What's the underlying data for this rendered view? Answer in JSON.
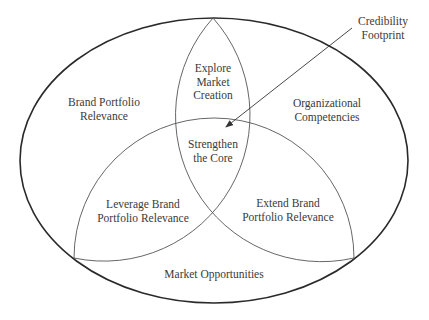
{
  "diagram": {
    "type": "venn-ellipse",
    "colors": {
      "outer_stroke": "#2a2a2a",
      "inner_stroke": "#555555",
      "text": "#3a3a3a",
      "background": "#ffffff"
    },
    "outer_region": {
      "name": "outer-ellipse"
    },
    "labels": {
      "brand_portfolio_relevance": [
        "Brand Portfolio",
        "Relevance"
      ],
      "explore_market_creation": [
        "Explore",
        "Market",
        "Creation"
      ],
      "organizational_competencies": [
        "Organizational",
        "Competencies"
      ],
      "strengthen_the_core": [
        "Strengthen",
        "the Core"
      ],
      "leverage_brand_portfolio_relevance": [
        "Leverage Brand",
        "Portfolio Relevance"
      ],
      "extend_brand_portfolio_relevance": [
        "Extend Brand",
        "Portfolio Relevance"
      ],
      "market_opportunities": [
        "Market Opportunities"
      ],
      "credibility_footprint": [
        "Credibility",
        "Footprint"
      ]
    },
    "callout": {
      "label_key": "credibility_footprint",
      "points_to": "strengthen_the_core"
    }
  }
}
